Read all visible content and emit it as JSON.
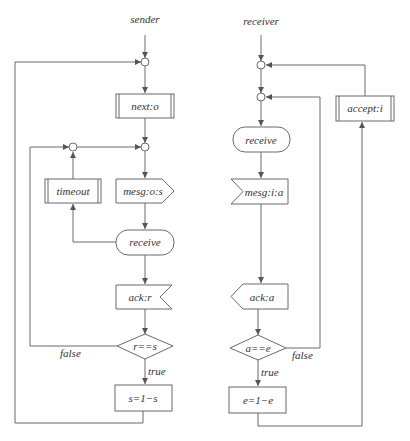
{
  "diagram": {
    "sender": {
      "title": "sender",
      "next": "next:o",
      "timeout": "timeout",
      "send_msg": "mesg:o:s",
      "receive": "receive",
      "ack": "ack:r",
      "decision": "r==s",
      "false_label": "false",
      "true_label": "true",
      "update": "s=1−s"
    },
    "receiver": {
      "title": "receiver",
      "accept": "accept:i",
      "receive": "receive",
      "recv_msg": "mesg:i:a",
      "ack": "ack:a",
      "decision": "a==e",
      "false_label": "false",
      "true_label": "true",
      "update": "e=1−e"
    },
    "colors": {
      "stroke": "#6a6a6a",
      "text": "#333333",
      "background": "#ffffff"
    }
  }
}
